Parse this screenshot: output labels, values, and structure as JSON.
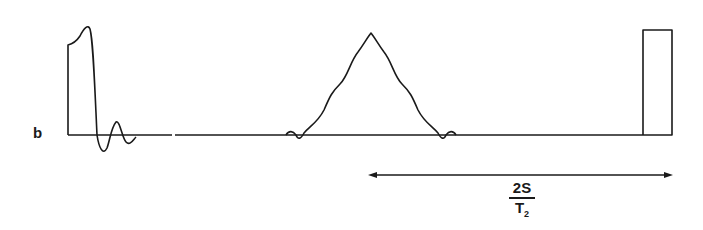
{
  "figure": {
    "panel_label": "b",
    "interval_label": {
      "numerator": "2S",
      "denominator_main": "T",
      "denominator_sub": "2"
    },
    "elements": [
      "left pulse with ringing",
      "central triangular echo with ripples",
      "right rectangular pulse",
      "double-headed arrow spanning echo center to right pulse"
    ],
    "line_color": "#1a1a1a"
  }
}
